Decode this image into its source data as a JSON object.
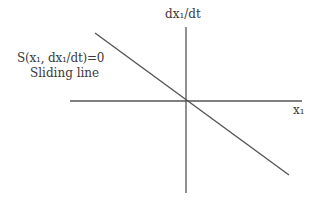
{
  "diagram": {
    "type": "phase-plane",
    "axes": {
      "x_label": "x₁",
      "y_label": "dx₁/dt"
    },
    "sliding_line": {
      "equation": "S(x₁, dx₁/dt)=0",
      "name": "Sliding line",
      "direction": "negative slope through origin"
    },
    "colors": {
      "background": "#ffffff",
      "lines": "#555555",
      "text": "#3a3a3a"
    },
    "geometry": {
      "origin": [
        186,
        101
      ],
      "x_axis": {
        "x1": 70,
        "y1": 101,
        "x2": 302,
        "y2": 101
      },
      "y_axis": {
        "x1": 186,
        "y1": 27,
        "x2": 186,
        "y2": 193
      },
      "sliding_line": {
        "x1": 95,
        "y1": 33,
        "x2": 289,
        "y2": 175
      }
    }
  }
}
